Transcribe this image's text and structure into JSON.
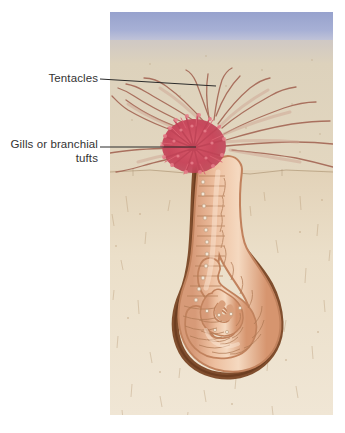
{
  "figure": {
    "kind": "scientific-illustration",
    "panel": {
      "x": 110,
      "y": 12,
      "width": 223,
      "height": 403
    },
    "background_color": "#ffffff"
  },
  "labels": {
    "tentacles": {
      "text": "Tentacles",
      "color": "#333333"
    },
    "gills": {
      "text": "Gills or branchial\ntufts",
      "color": "#333333"
    }
  },
  "leaders": {
    "tentacles": {
      "x1": 100,
      "y1": 79,
      "x2": 216,
      "y2": 86
    },
    "gills": {
      "x1": 100,
      "y1": 147,
      "x2": 196,
      "y2": 147
    },
    "color": "#2b2b2b"
  },
  "scene": {
    "water": {
      "label": "water column",
      "color_top": "#9aa4cf",
      "color_bottom": "#bfc4de",
      "y_top": 12,
      "y_bottom": 44
    },
    "surface_sand": {
      "label": "surface sediment",
      "color": "#ddd0b8",
      "y_top": 40,
      "y_bottom": 172
    },
    "deep_sediment": {
      "label": "deep sediment",
      "color": "#e7d9c2",
      "y_top": 170,
      "y_bottom": 415
    },
    "sediment_line": {
      "label": "sediment layer boundary",
      "y": 171,
      "color": "#b9a486"
    },
    "burrow": {
      "label": "burrow wall",
      "color": "#7a4028"
    },
    "worm_body": {
      "label": "segmented worm body",
      "color": "#e8b292",
      "shadow": "#c98a66",
      "highlight": "#f6dcc6"
    },
    "setae": {
      "label": "setae row",
      "color": "#f0e2d2"
    },
    "gill_tuft": {
      "label": "branchial tufts",
      "color": "#c8485c",
      "color_light": "#e0707f"
    },
    "tentacles": {
      "label": "feeding tentacles",
      "color": "#a9705e",
      "count": 17
    }
  }
}
